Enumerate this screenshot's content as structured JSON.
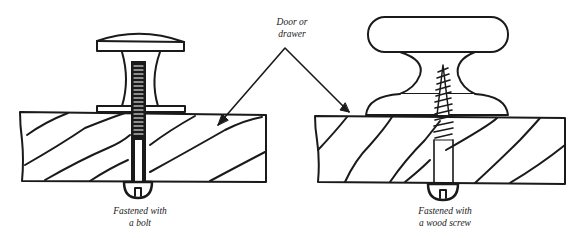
{
  "diagram": {
    "colors": {
      "ink": "#1a1a1a",
      "background": "#ffffff"
    },
    "labels": {
      "door_line1": "Door or",
      "door_line2": "drawer",
      "bolt_line1": "Fastened with",
      "bolt_line2": "a bolt",
      "screw_line1": "Fastened with",
      "screw_line2": "a wood screw"
    },
    "figures": [
      {
        "id": "bolt-figure",
        "fastener": "bolt"
      },
      {
        "id": "screw-figure",
        "fastener": "wood screw"
      }
    ]
  }
}
